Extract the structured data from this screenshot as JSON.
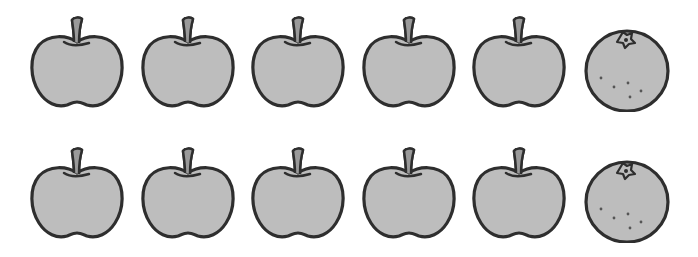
{
  "colors": {
    "fill": "#bdbdbd",
    "outline": "#2e2e2e",
    "stem": "#9a9a9a",
    "background": "#ffffff"
  },
  "rows": [
    {
      "items": [
        {
          "type": "apple",
          "x": 27,
          "y": 12
        },
        {
          "type": "apple",
          "x": 138,
          "y": 12
        },
        {
          "type": "apple",
          "x": 248,
          "y": 12
        },
        {
          "type": "apple",
          "x": 359,
          "y": 12
        },
        {
          "type": "apple",
          "x": 469,
          "y": 12
        },
        {
          "type": "orange",
          "x": 577,
          "y": 12
        }
      ]
    },
    {
      "items": [
        {
          "type": "apple",
          "x": 27,
          "y": 143
        },
        {
          "type": "apple",
          "x": 138,
          "y": 143
        },
        {
          "type": "apple",
          "x": 248,
          "y": 143
        },
        {
          "type": "apple",
          "x": 359,
          "y": 143
        },
        {
          "type": "apple",
          "x": 469,
          "y": 143
        },
        {
          "type": "orange",
          "x": 577,
          "y": 143
        }
      ]
    }
  ],
  "counts": {
    "apples_per_row": 5,
    "oranges_per_row": 1,
    "total_apples": 10,
    "total_oranges": 2
  }
}
